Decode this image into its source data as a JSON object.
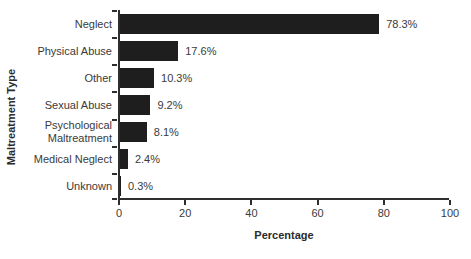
{
  "chart_data": {
    "type": "bar",
    "orientation": "horizontal",
    "title": "",
    "xlabel": "Percentage",
    "ylabel": "Maltreatment Type",
    "categories": [
      "Neglect",
      "Physical Abuse",
      "Other",
      "Sexual Abuse",
      "Psychological Maltreatment",
      "Medical Neglect",
      "Unknown"
    ],
    "values": [
      78.3,
      17.6,
      10.3,
      9.2,
      8.1,
      2.4,
      0.3
    ],
    "value_labels": [
      "78.3%",
      "17.6%",
      "10.3%",
      "9.2%",
      "8.1%",
      "2.4%",
      "0.3%"
    ],
    "xlim": [
      0,
      100
    ],
    "xticks": [
      "0",
      "20",
      "40",
      "60",
      "80",
      "100"
    ],
    "grid": false,
    "legend": false,
    "bar_color": "#1e1e1e",
    "axis_color": "#2e2e2e",
    "text_color": "#3a3a3a",
    "background": "#ffffff"
  }
}
